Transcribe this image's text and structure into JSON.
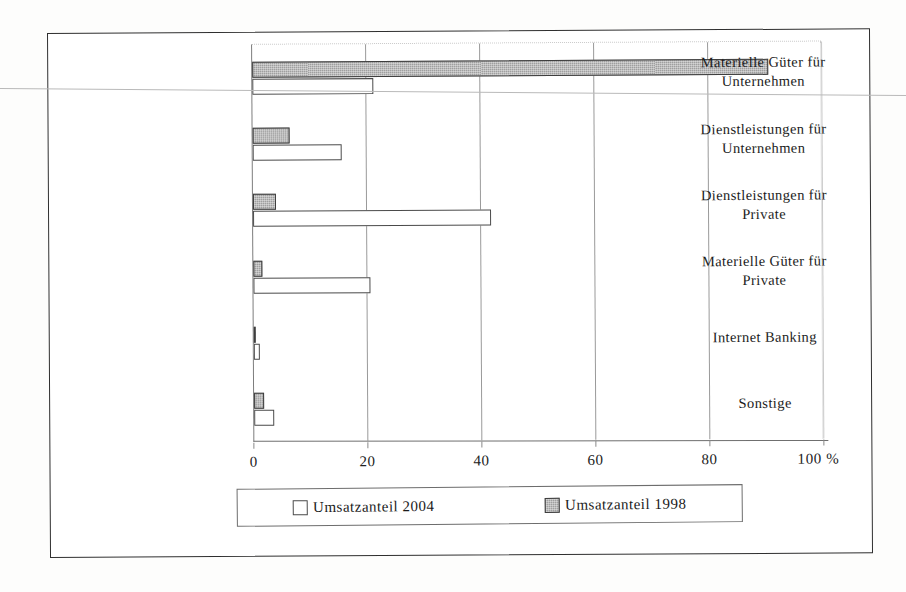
{
  "chart_data": {
    "type": "bar",
    "orientation": "horizontal",
    "title": "",
    "xlabel": "",
    "ylabel": "",
    "xlim": [
      0,
      100
    ],
    "xticks": [
      0,
      20,
      40,
      60,
      80,
      100
    ],
    "xtick_labels": [
      "0",
      "20",
      "40",
      "60",
      "80",
      "100 %"
    ],
    "unit": "%",
    "grid": true,
    "legend_position": "bottom",
    "categories": [
      "Materielle Güter für Unternehmen",
      "Dienstleistungen für Unternehmen",
      "Dienstleistungen für Private",
      "Materielle Güter für Private",
      "Internet Banking",
      "Sonstige"
    ],
    "category_lines": [
      [
        "Materielle Güter für",
        "Unternehmen"
      ],
      [
        "Dienstleistungen für",
        "Unternehmen"
      ],
      [
        "Dienstleistungen für",
        "Private"
      ],
      [
        "Materielle Güter für",
        "Private"
      ],
      [
        "Internet Banking"
      ],
      [
        "Sonstige"
      ]
    ],
    "series": [
      {
        "name": "Umsatzanteil 2004",
        "key": "y2004",
        "color": "#ffffff",
        "values": [
          21.2,
          15.7,
          41.7,
          20.5,
          1.0,
          3.5
        ]
      },
      {
        "name": "Umsatzanteil 1998",
        "key": "y1998",
        "color": "#9f9f9f",
        "values": [
          90.5,
          6.5,
          4.0,
          1.5,
          0.2,
          1.8
        ]
      }
    ]
  },
  "legend": {
    "entries": [
      {
        "label": "Umsatzanteil 2004",
        "swatch": "white"
      },
      {
        "label": "Umsatzanteil 1998",
        "swatch": "gray"
      }
    ]
  },
  "axis": {
    "tick_labels": [
      "0",
      "20",
      "40",
      "60",
      "80",
      "100 %"
    ]
  },
  "colors": {
    "frame": "#2f2f2f",
    "grid": "#9a9a9a",
    "bar_1998": "#9f9f9f",
    "bar_2004": "#ffffff",
    "bar_outline": "#4a4a4a",
    "text": "#1b1b1b"
  }
}
